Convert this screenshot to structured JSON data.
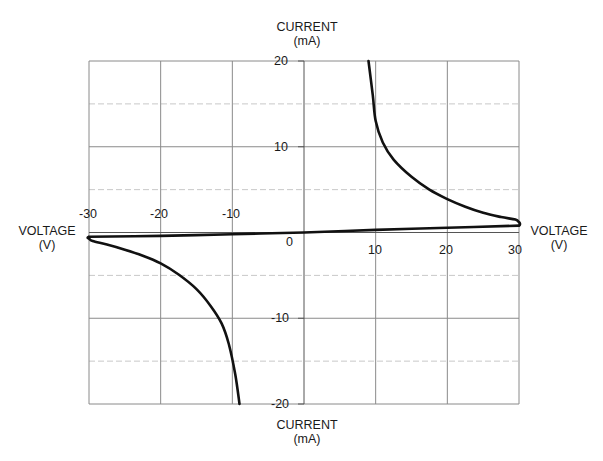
{
  "chart_data": {
    "type": "line",
    "title": "",
    "xlabel": "VOLTAGE (V)",
    "ylabel": "CURRENT (mA)",
    "xlim": [
      -30,
      30
    ],
    "ylim": [
      -20,
      20
    ],
    "grid": true,
    "legend": null,
    "x_ticks": [
      "-30",
      "-20",
      "-10",
      "0",
      "10",
      "20",
      "30"
    ],
    "y_ticks": [
      "20",
      "10",
      "-10",
      "-20"
    ],
    "series": [
      {
        "name": "upper-branch",
        "x": [
          9.0,
          9.6,
          10.0,
          11.0,
          12.5,
          15.0,
          17.5,
          20.0,
          22.5,
          25.0,
          27.5,
          29.5,
          30.0
        ],
        "y": [
          20.0,
          16.0,
          13.0,
          10.5,
          8.5,
          6.5,
          5.0,
          3.9,
          3.0,
          2.3,
          1.8,
          1.5,
          1.2
        ]
      },
      {
        "name": "linear-return",
        "x": [
          30.0,
          20.0,
          10.0,
          0.0,
          -10.0,
          -20.0,
          -30.0
        ],
        "y": [
          0.8,
          0.55,
          0.3,
          0.0,
          -0.2,
          -0.4,
          -0.5
        ]
      },
      {
        "name": "lower-branch",
        "x": [
          -30.0,
          -29.5,
          -27.5,
          -25.0,
          -22.5,
          -20.0,
          -17.5,
          -15.0,
          -13.0,
          -11.5,
          -10.5,
          -9.6,
          -9.0
        ],
        "y": [
          -0.7,
          -1.0,
          -1.4,
          -2.0,
          -2.7,
          -3.6,
          -4.9,
          -6.6,
          -8.6,
          -10.6,
          -13.0,
          -16.5,
          -20.0
        ]
      }
    ],
    "annotations": {
      "top_axis_label": [
        "CURRENT",
        "(mA)"
      ],
      "bottom_axis_label": [
        "CURRENT",
        "(mA)"
      ],
      "left_axis_label": [
        "VOLTAGE",
        "(V)"
      ],
      "right_axis_label": [
        "VOLTAGE",
        "(V)"
      ]
    }
  },
  "labels": {
    "top_current": "CURRENT",
    "top_ma": "(mA)",
    "bottom_current": "CURRENT",
    "bottom_ma": "(mA)",
    "left_voltage": "VOLTAGE",
    "left_v": "(V)",
    "right_voltage": "VOLTAGE",
    "right_v": "(V)"
  },
  "ticks": {
    "x_neg30": "-30",
    "x_neg20": "-20",
    "x_neg10": "-10",
    "origin": "0",
    "x_10": "10",
    "x_20": "20",
    "x_30": "30",
    "y_20": "20",
    "y_10": "10",
    "y_neg10": "-10",
    "y_neg20": "-20"
  },
  "colors": {
    "curve": "#111111",
    "major_grid": "#8a8a8a",
    "minor_grid": "#c8c8c8"
  }
}
